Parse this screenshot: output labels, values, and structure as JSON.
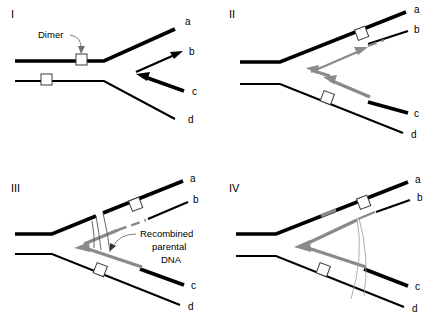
{
  "figure": {
    "panel_count": 4,
    "colors": {
      "strand_black": "#000000",
      "strand_gray": "#8a8a8a",
      "dimer_outline": "#3a3a3a",
      "background": "#ffffff"
    },
    "arm_labels": [
      "a",
      "b",
      "c",
      "d"
    ]
  },
  "panels": [
    {
      "id": "I",
      "roman": "I",
      "arms": {
        "a": "a",
        "b": "b",
        "c": "c",
        "d": "d"
      },
      "callout": {
        "text": "Dimer",
        "points_to": "dimer-square-upper"
      },
      "dimers": 2,
      "description": "Parental duplex with two pyrimidine dimers; daughter strands a,b,c,d emerging at fork"
    },
    {
      "id": "II",
      "roman": "II",
      "arms": {
        "a": "a",
        "b": "b",
        "c": "c",
        "d": "d"
      },
      "dimers": 2,
      "description": "Gray nascent strands with arrowheads showing strand exchange toward the fork"
    },
    {
      "id": "III",
      "roman": "III",
      "arms": {
        "a": "a",
        "b": "b",
        "c": "c",
        "d": "d"
      },
      "callout": {
        "lines": [
          "Recombined",
          "parental",
          "DNA"
        ],
        "points_to": "strand-crossover-junction"
      },
      "dimers": 2,
      "description": "Crossed-strand junction forming recombined parental DNA"
    },
    {
      "id": "IV",
      "roman": "IV",
      "arms": {
        "a": "a",
        "b": "b",
        "c": "c",
        "d": "d"
      },
      "dimers": 2,
      "description": "Resolved structure with gray recombined segments integrated into arms a and b"
    }
  ]
}
